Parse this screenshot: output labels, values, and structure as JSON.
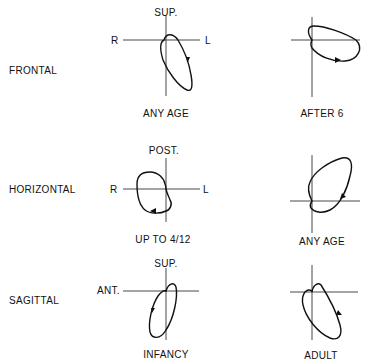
{
  "rows": [
    {
      "plane": "FRONTAL",
      "panels": [
        {
          "top_label": "SUP.",
          "left_label": "R",
          "right_label": "L",
          "caption": "ANY AGE"
        },
        {
          "top_label": "",
          "left_label": "",
          "right_label": "",
          "caption": "AFTER 6"
        }
      ]
    },
    {
      "plane": "HORIZONTAL",
      "panels": [
        {
          "top_label": "POST.",
          "left_label": "R",
          "right_label": "L",
          "caption": "UP TO 4/12"
        },
        {
          "top_label": "",
          "left_label": "",
          "right_label": "",
          "caption": "ANY AGE"
        }
      ]
    },
    {
      "plane": "SAGITTAL",
      "panels": [
        {
          "top_label": "SUP.",
          "left_label": "ANT.",
          "right_label": "",
          "caption": "INFANCY"
        },
        {
          "top_label": "",
          "left_label": "",
          "right_label": "",
          "caption": "ADULT"
        }
      ]
    }
  ],
  "colors": {
    "ink": "#111111",
    "background": "#ffffff"
  }
}
